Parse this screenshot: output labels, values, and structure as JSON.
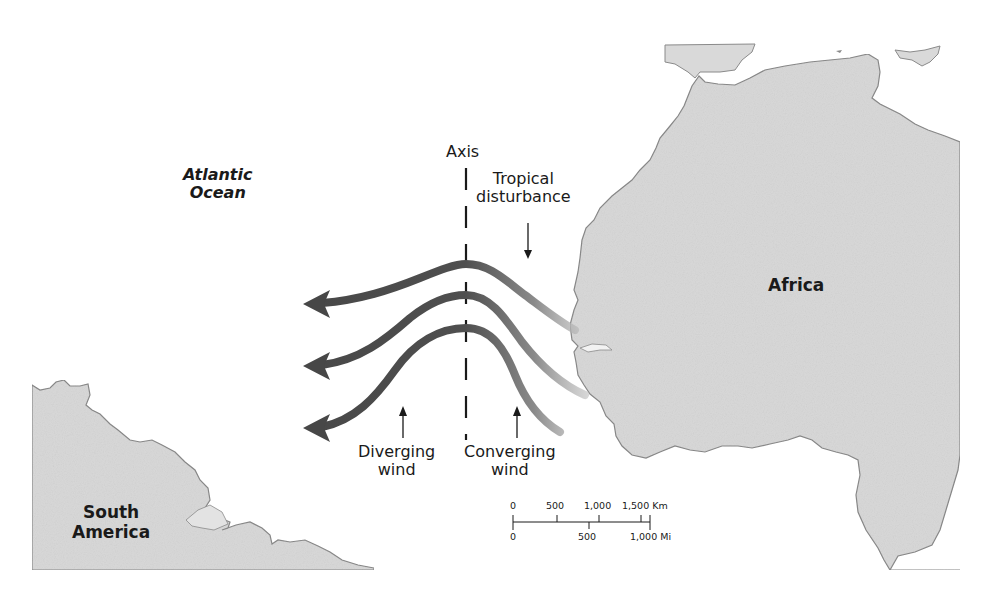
{
  "map": {
    "regions": {
      "africa": "Africa",
      "south_america": "South\nAmerica",
      "south_america_line1": "South",
      "south_america_line2": "America",
      "ocean_line1": "Atlantic",
      "ocean_line2": "Ocean"
    },
    "annotations": {
      "axis": "Axis",
      "tropical_line1": "Tropical",
      "tropical_line2": "disturbance",
      "diverging_line1": "Diverging",
      "diverging_line2": "wind",
      "converging_line1": "Converging",
      "converging_line2": "wind"
    },
    "scale_bar": {
      "km_labels": [
        "0",
        "500",
        "1,000",
        "1,500 Km"
      ],
      "mi_labels": [
        "0",
        "500",
        "1,000 Mi"
      ]
    },
    "wind_arrows": {
      "count": 3,
      "direction": "westward",
      "color_dark": "#4a4a4a",
      "color_light": "#bdbdbd"
    },
    "colors": {
      "land": "#d9d9d9",
      "coast": "#8a8a8a",
      "ocean": "#ffffff",
      "text": "#1a1a1a"
    }
  }
}
